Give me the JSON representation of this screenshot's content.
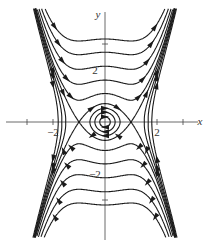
{
  "figure": {
    "type": "phase_portrait",
    "system": "x' = y, y' = -x + x^3",
    "axes": {
      "x_label": "x",
      "y_label": "y",
      "x_tick_labels": [
        {
          "value": -2,
          "text": "−2"
        },
        {
          "value": 2,
          "text": "2"
        }
      ],
      "y_tick_labels": [
        {
          "value": 2,
          "text": "2"
        },
        {
          "value": -2,
          "text": "−2"
        }
      ],
      "x_ticks": [
        -3,
        -2,
        2,
        3
      ],
      "y_ticks": [
        3,
        -3
      ],
      "xlim": [
        -4,
        4
      ],
      "ylim": [
        -4.5,
        4.6
      ]
    },
    "equilibria": [
      {
        "x": -1,
        "y": 0,
        "kind": "saddle"
      },
      {
        "x": 0,
        "y": 0,
        "kind": "center"
      },
      {
        "x": 1,
        "y": 0,
        "kind": "saddle"
      }
    ],
    "closed_orbits_energy": [
      0.02,
      0.07,
      0.14
    ],
    "separatrix_energy": 0.25,
    "open_orbits_energy": [
      0.6,
      1.3,
      2.3,
      3.6,
      5.1
    ],
    "outer_orbits_energy": [
      -0.15,
      -0.5,
      -1.0
    ],
    "colors": {
      "curve": "#1a1a1a",
      "axis": "#444444"
    }
  }
}
